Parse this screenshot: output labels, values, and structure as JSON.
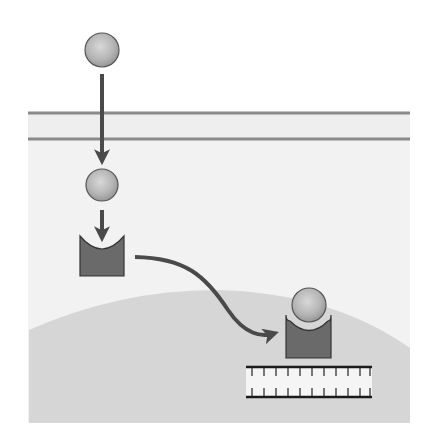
{
  "diagram": {
    "type": "signal-transduction",
    "colors": {
      "background": "#ffffff",
      "cytoplasm": "#f2f2f2",
      "membrane_fill": "#eeeeee",
      "membrane_line": "#8a8a8a",
      "nucleus": "#d6d6d6",
      "ligand": "#b8b8b8",
      "ligand_stroke": "#555555",
      "receptor": "#6a6a6a",
      "receptor_stroke": "#333333",
      "arrow": "#4a4a4a",
      "dna_line": "#1a1a1a",
      "dna_fill": "#f5f5f5"
    },
    "elements": {
      "ligand_outside": {
        "cx": 102,
        "cy": 50,
        "r": 17
      },
      "ligand_inside": {
        "cx": 102,
        "cy": 185,
        "r": 16
      },
      "receptor_free": {
        "x": 80,
        "y": 236,
        "w": 44,
        "h": 40
      },
      "complex_ligand": {
        "cx": 309,
        "cy": 305,
        "r": 17
      },
      "complex_receptor": {
        "x": 286,
        "y": 315,
        "w": 45,
        "h": 43
      },
      "membrane": {
        "x1": 28,
        "x2": 410,
        "y_top": 113,
        "y_bottom": 139
      },
      "dna": {
        "x1": 246,
        "x2": 372,
        "y_top": 367,
        "y_bottom": 397,
        "ticks": 11
      }
    }
  }
}
